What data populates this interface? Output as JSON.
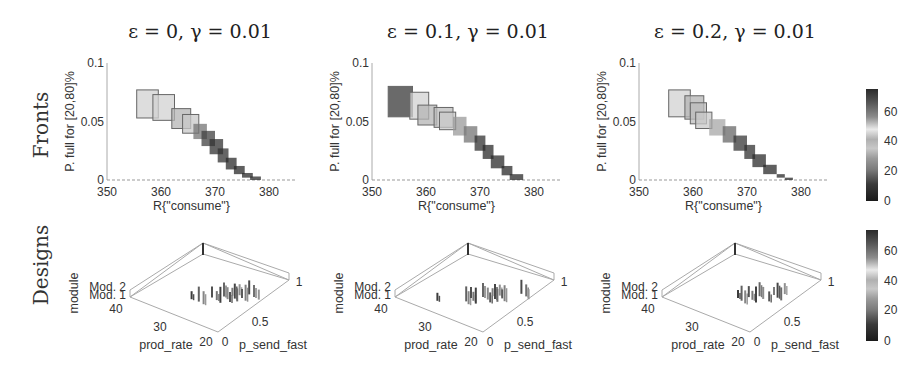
{
  "row_labels": {
    "fronts": "Fronts",
    "designs": "Designs"
  },
  "chart_data": [
    {
      "type": "scatter",
      "panel": "fronts",
      "title": "ε = 0, γ = 0.01",
      "xlabel": "R{\"consume\"}",
      "ylabel": "P. full for [20,80]%",
      "xlim": [
        350,
        385
      ],
      "ylim": [
        0,
        0.1
      ],
      "xticks": [
        "350",
        "360",
        "370",
        "380"
      ],
      "yticks": [
        "0",
        "0.05",
        "0.1"
      ],
      "marker": "rectangle (size proportional to uncertainty), colored by colorbar value",
      "points": [
        {
          "x1": 355.5,
          "x2": 359.5,
          "y1": 0.053,
          "y2": 0.077,
          "c": 45
        },
        {
          "x1": 358.5,
          "x2": 362.5,
          "y1": 0.051,
          "y2": 0.073,
          "c": 45
        },
        {
          "x1": 362.0,
          "x2": 365.5,
          "y1": 0.044,
          "y2": 0.061,
          "c": 40
        },
        {
          "x1": 364.0,
          "x2": 367.0,
          "y1": 0.04,
          "y2": 0.056,
          "c": 35
        },
        {
          "x1": 366.0,
          "x2": 368.5,
          "y1": 0.035,
          "y2": 0.048,
          "c": 20
        },
        {
          "x1": 367.5,
          "x2": 370.0,
          "y1": 0.029,
          "y2": 0.042,
          "c": 12
        },
        {
          "x1": 369.0,
          "x2": 371.5,
          "y1": 0.022,
          "y2": 0.035,
          "c": 8
        },
        {
          "x1": 370.5,
          "x2": 372.5,
          "y1": 0.015,
          "y2": 0.027,
          "c": 8
        },
        {
          "x1": 372.0,
          "x2": 374.0,
          "y1": 0.009,
          "y2": 0.019,
          "c": 6
        },
        {
          "x1": 373.5,
          "x2": 375.5,
          "y1": 0.005,
          "y2": 0.012,
          "c": 5
        },
        {
          "x1": 375.0,
          "x2": 377.0,
          "y1": 0.002,
          "y2": 0.006,
          "c": 5
        },
        {
          "x1": 376.5,
          "x2": 378.5,
          "y1": 0.0,
          "y2": 0.003,
          "c": 5
        }
      ]
    },
    {
      "type": "scatter",
      "panel": "fronts",
      "title": "ε = 0.1, γ = 0.01",
      "xlabel": "R{\"consume\"}",
      "ylabel": "P. full for [20,80]%",
      "xlim": [
        350,
        385
      ],
      "ylim": [
        0,
        0.1
      ],
      "xticks": [
        "350",
        "360",
        "370",
        "380"
      ],
      "yticks": [
        "0",
        "0.05",
        "0.1"
      ],
      "points": [
        {
          "x1": 353.0,
          "x2": 357.5,
          "y1": 0.054,
          "y2": 0.08,
          "c": 72
        },
        {
          "x1": 357.0,
          "x2": 360.5,
          "y1": 0.052,
          "y2": 0.075,
          "c": 45
        },
        {
          "x1": 358.5,
          "x2": 362.0,
          "y1": 0.047,
          "y2": 0.064,
          "c": 40
        },
        {
          "x1": 361.5,
          "x2": 365.0,
          "y1": 0.045,
          "y2": 0.062,
          "c": 38
        },
        {
          "x1": 362.5,
          "x2": 365.5,
          "y1": 0.043,
          "y2": 0.058,
          "c": 35
        },
        {
          "x1": 365.0,
          "x2": 367.5,
          "y1": 0.038,
          "y2": 0.054,
          "c": 28
        },
        {
          "x1": 367.0,
          "x2": 369.5,
          "y1": 0.032,
          "y2": 0.046,
          "c": 20
        },
        {
          "x1": 369.0,
          "x2": 371.0,
          "y1": 0.025,
          "y2": 0.038,
          "c": 8
        },
        {
          "x1": 370.5,
          "x2": 372.5,
          "y1": 0.018,
          "y2": 0.03,
          "c": 6
        },
        {
          "x1": 372.0,
          "x2": 374.5,
          "y1": 0.01,
          "y2": 0.021,
          "c": 6
        },
        {
          "x1": 374.0,
          "x2": 376.0,
          "y1": 0.004,
          "y2": 0.012,
          "c": 5
        },
        {
          "x1": 375.5,
          "x2": 378.0,
          "y1": 0.0,
          "y2": 0.005,
          "c": 5
        }
      ]
    },
    {
      "type": "scatter",
      "panel": "fronts",
      "title": "ε = 0.2, γ = 0.01",
      "xlabel": "R{\"consume\"}",
      "ylabel": "P. full for [20,80]%",
      "xlim": [
        350,
        385
      ],
      "ylim": [
        0,
        0.1
      ],
      "xticks": [
        "350",
        "360",
        "370",
        "380"
      ],
      "yticks": [
        "0",
        "0.05",
        "0.1"
      ],
      "points": [
        {
          "x1": 355.5,
          "x2": 359.5,
          "y1": 0.054,
          "y2": 0.077,
          "c": 45
        },
        {
          "x1": 358.5,
          "x2": 362.0,
          "y1": 0.052,
          "y2": 0.072,
          "c": 40
        },
        {
          "x1": 359.5,
          "x2": 362.5,
          "y1": 0.048,
          "y2": 0.066,
          "c": 38
        },
        {
          "x1": 360.5,
          "x2": 363.5,
          "y1": 0.044,
          "y2": 0.058,
          "c": 35
        },
        {
          "x1": 363.0,
          "x2": 366.0,
          "y1": 0.038,
          "y2": 0.052,
          "c": 30
        },
        {
          "x1": 365.5,
          "x2": 368.0,
          "y1": 0.032,
          "y2": 0.046,
          "c": 18
        },
        {
          "x1": 367.5,
          "x2": 370.0,
          "y1": 0.025,
          "y2": 0.038,
          "c": 10
        },
        {
          "x1": 369.5,
          "x2": 371.5,
          "y1": 0.018,
          "y2": 0.03,
          "c": 8
        },
        {
          "x1": 371.0,
          "x2": 373.5,
          "y1": 0.011,
          "y2": 0.022,
          "c": 6
        },
        {
          "x1": 373.0,
          "x2": 375.5,
          "y1": 0.005,
          "y2": 0.013,
          "c": 5
        },
        {
          "x1": 375.5,
          "x2": 377.0,
          "y1": 0.002,
          "y2": 0.005,
          "c": 5
        },
        {
          "x1": 377.0,
          "x2": 378.5,
          "y1": 0.0,
          "y2": 0.002,
          "c": 5
        }
      ]
    },
    {
      "type": "scatter3d",
      "panel": "designs",
      "xlabel": "prod_rate",
      "ylabel": "p_send_fast",
      "zlabel": "module",
      "xticks": [
        "20",
        "30",
        "40"
      ],
      "yticks": [
        "0",
        "0.5",
        "1"
      ],
      "zticks": [
        "Mod. 1",
        "Mod. 2"
      ],
      "bars_u": [
        0.28,
        0.34,
        0.38,
        0.45,
        0.49,
        0.52,
        0.55,
        0.58,
        0.6,
        0.62,
        0.64,
        0.66,
        0.68,
        0.7,
        0.73,
        0.76,
        0.8,
        0.84
      ]
    },
    {
      "type": "scatter3d",
      "panel": "designs",
      "xlabel": "prod_rate",
      "ylabel": "p_send_fast",
      "zlabel": "module",
      "xticks": [
        "20",
        "30",
        "40"
      ],
      "yticks": [
        "0",
        "0.5",
        "1"
      ],
      "zticks": [
        "Mod. 1",
        "Mod. 2"
      ],
      "bars_u": [
        0.12,
        0.36,
        0.38,
        0.4,
        0.42,
        0.44,
        0.5,
        0.54,
        0.56,
        0.58,
        0.6,
        0.62,
        0.64,
        0.66,
        0.68,
        0.82,
        0.86,
        0.88
      ]
    },
    {
      "type": "scatter3d",
      "panel": "designs",
      "xlabel": "prod_rate",
      "ylabel": "p_send_fast",
      "zlabel": "module",
      "xticks": [
        "20",
        "30",
        "40"
      ],
      "yticks": [
        "0",
        "0.5",
        "1"
      ],
      "zticks": [
        "Mod. 1",
        "Mod. 2"
      ],
      "bars_u": [
        0.4,
        0.43,
        0.46,
        0.49,
        0.52,
        0.55,
        0.58,
        0.61,
        0.66,
        0.7,
        0.73,
        0.76,
        0.79
      ]
    }
  ],
  "colorbar": {
    "ticks": [
      "0",
      "20",
      "40",
      "60"
    ],
    "range": [
      0,
      75
    ]
  }
}
